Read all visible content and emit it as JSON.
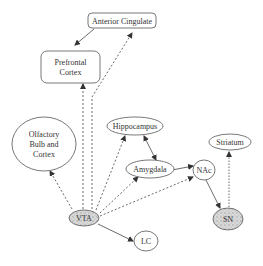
{
  "diagram": {
    "type": "brain-region pathway diagram",
    "nodes": [
      {
        "id": "anterior_cingulate",
        "label": "Anterior Cingulate",
        "shape": "rounded-rect"
      },
      {
        "id": "prefrontal_cortex",
        "label_lines": [
          "Prefrontal",
          "Cortex"
        ],
        "shape": "rounded-rect"
      },
      {
        "id": "olfactory",
        "label_lines": [
          "Olfactory",
          "Bulb and",
          "Cortex"
        ],
        "shape": "ellipse"
      },
      {
        "id": "hippocampus",
        "label": "Hippocampus",
        "shape": "ellipse"
      },
      {
        "id": "amygdala",
        "label": "Amygdala",
        "shape": "ellipse"
      },
      {
        "id": "nac",
        "label": "NAc",
        "shape": "ellipse"
      },
      {
        "id": "striatum",
        "label": "Striatum",
        "shape": "ellipse"
      },
      {
        "id": "vta",
        "label": "VTA",
        "shape": "ellipse",
        "shaded": true
      },
      {
        "id": "sn",
        "label": "SN",
        "shape": "ellipse",
        "shaded": true
      },
      {
        "id": "lc",
        "label": "LC",
        "shape": "ellipse"
      }
    ],
    "edges": [
      {
        "from": "anterior_cingulate",
        "to": "prefrontal_cortex",
        "style": "solid"
      },
      {
        "from": "vta",
        "to": "prefrontal_cortex",
        "style": "dashed"
      },
      {
        "from": "vta",
        "to": "anterior_cingulate",
        "style": "dashed"
      },
      {
        "from": "vta",
        "to": "olfactory",
        "style": "dashed"
      },
      {
        "from": "vta",
        "to": "hippocampus",
        "style": "dashed"
      },
      {
        "from": "vta",
        "to": "amygdala",
        "style": "dashed"
      },
      {
        "from": "vta",
        "to": "nac",
        "style": "dashed"
      },
      {
        "from": "vta",
        "to": "lc",
        "style": "solid"
      },
      {
        "from": "hippocampus",
        "to": "amygdala",
        "style": "solid",
        "bidirectional": true
      },
      {
        "from": "amygdala",
        "to": "nac",
        "style": "solid"
      },
      {
        "from": "nac",
        "to": "sn",
        "style": "solid"
      },
      {
        "from": "sn",
        "to": "striatum",
        "style": "dashed"
      }
    ]
  }
}
